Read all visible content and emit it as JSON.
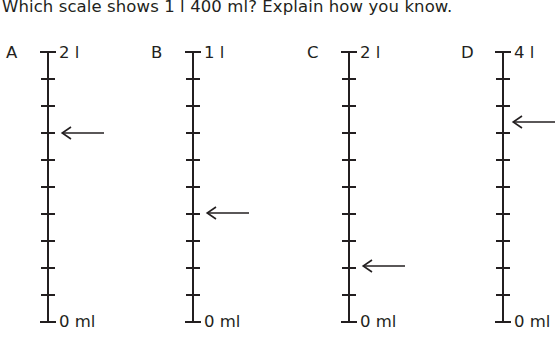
{
  "question": {
    "text": "Which scale shows 1 l 400 ml? Explain how you know."
  },
  "scales": [
    {
      "letter": "A",
      "top_label": "2 l",
      "bottom_label": "0 ml",
      "max_value_l": 2,
      "min_label_ml": 0,
      "intervals": 10,
      "arrow_icon": "left-arrow-icon",
      "arrow_at_interval": 7,
      "arrow_value": "1 l 400 ml"
    },
    {
      "letter": "B",
      "top_label": "1 l",
      "bottom_label": "0 ml",
      "max_value_l": 1,
      "min_label_ml": 0,
      "intervals": 10,
      "arrow_icon": "left-arrow-icon",
      "arrow_at_interval": 4,
      "arrow_value": "400 ml"
    },
    {
      "letter": "C",
      "top_label": "2 l",
      "bottom_label": "0 ml",
      "max_value_l": 2,
      "min_label_ml": 0,
      "intervals": 10,
      "arrow_icon": "left-arrow-icon",
      "arrow_at_interval": 2,
      "arrow_value": "400 ml"
    },
    {
      "letter": "D",
      "top_label": "4 l",
      "bottom_label": "0 ml",
      "max_value_l": 4,
      "min_label_ml": 0,
      "intervals": 10,
      "arrow_icon": "left-arrow-icon",
      "arrow_at_interval": 7.5,
      "arrow_value": "3 l"
    }
  ],
  "colors": {
    "ink": "#231f20",
    "background": "#ffffff"
  }
}
